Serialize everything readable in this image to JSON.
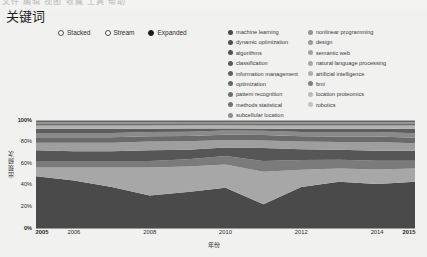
{
  "window": {
    "ghost_strip_text": "文件  编辑  视图  收藏  工具  帮助"
  },
  "header": {
    "title": "关键词"
  },
  "layout_controls": {
    "name": "layout",
    "options": [
      {
        "label": "Stacked",
        "selected": false
      },
      {
        "label": "Stream",
        "selected": false
      },
      {
        "label": "Expanded",
        "selected": true
      }
    ]
  },
  "legend": {
    "position": "top-right",
    "columns": [
      [
        {
          "label": "machine learning",
          "color": "#4a4a4a"
        },
        {
          "label": "dynamic optimization",
          "color": "#4f4f4f"
        },
        {
          "label": "algorithms",
          "color": "#545454"
        },
        {
          "label": "classification",
          "color": "#5a5a5a"
        },
        {
          "label": "information management",
          "color": "#616161"
        },
        {
          "label": "optimization",
          "color": "#676767"
        },
        {
          "label": "pattern recognition",
          "color": "#6e6e6e"
        },
        {
          "label": "methods  statistical",
          "color": "#757575"
        },
        {
          "label": "subcellular location",
          "color": "#8e8e8e"
        }
      ],
      [
        {
          "label": "nonlinear programming",
          "color": "#949494"
        },
        {
          "label": "design",
          "color": "#9b9b9b"
        },
        {
          "label": "semantic web",
          "color": "#a2a2a2"
        },
        {
          "label": "natural language processing",
          "color": "#a9a9a9"
        },
        {
          "label": "artificial intelligence",
          "color": "#b0b0b0"
        },
        {
          "label": "bmi",
          "color": "#808080"
        },
        {
          "label": "location proteomics",
          "color": "#bcbcbc"
        },
        {
          "label": "robotics",
          "color": "#c4c4c4"
        }
      ]
    ]
  },
  "chart_data": {
    "type": "area",
    "title": "关键词",
    "xlabel": "年份",
    "ylabel": "出现频次",
    "grid": false,
    "legend_position": "top-right",
    "normalized": true,
    "xlim": [
      2005,
      2015
    ],
    "ylim": [
      0,
      100
    ],
    "x": [
      2005,
      2006,
      2007,
      2008,
      2009,
      2010,
      2011,
      2012,
      2013,
      2014,
      2015
    ],
    "xticks": [
      "2005",
      "2006",
      "2008",
      "2010",
      "2012",
      "2014",
      "2015"
    ],
    "xtick_values": [
      2005,
      2006,
      2008,
      2010,
      2012,
      2014,
      2015
    ],
    "xtick_bold": [
      true,
      false,
      false,
      false,
      false,
      false,
      true
    ],
    "yticks": [
      "0%",
      "20%",
      "40%",
      "60%",
      "80%",
      "100%"
    ],
    "ytick_values": [
      0,
      20,
      40,
      60,
      80,
      100
    ],
    "series": [
      {
        "name": "machine learning",
        "color": "#4a4a4a",
        "values": [
          48,
          44,
          38,
          30,
          34,
          38,
          22,
          38,
          42,
          40,
          42
        ]
      },
      {
        "name": "dynamic optimization",
        "color": "#4f4f4f",
        "values": [
          0,
          0,
          0,
          0,
          0,
          0,
          0,
          0,
          0,
          0,
          0
        ]
      },
      {
        "name": "algorithms",
        "color": "#a7a7a7",
        "values": [
          8,
          12,
          18,
          26,
          24,
          22,
          30,
          16,
          12,
          13,
          12
        ]
      },
      {
        "name": "classification",
        "color": "#7b7b7b",
        "values": [
          6,
          6,
          6,
          6,
          7,
          8,
          10,
          9,
          8,
          8,
          7
        ]
      },
      {
        "name": "information management",
        "color": "#565656",
        "values": [
          10,
          9,
          9,
          10,
          9,
          8,
          12,
          10,
          9,
          9,
          9
        ]
      },
      {
        "name": "optimization",
        "color": "#9e9e9e",
        "values": [
          7,
          8,
          8,
          8,
          8,
          7,
          7,
          7,
          7,
          8,
          7
        ]
      },
      {
        "name": "pattern recognition",
        "color": "#6a6a6a",
        "values": [
          5,
          5,
          5,
          5,
          5,
          5,
          5,
          5,
          5,
          5,
          5
        ]
      },
      {
        "name": "methods  statistical",
        "color": "#8a8a8a",
        "values": [
          4,
          4,
          4,
          4,
          4,
          4,
          4,
          4,
          4,
          4,
          4
        ]
      },
      {
        "name": "subcellular location",
        "color": "#5d5d5d",
        "values": [
          4,
          4,
          4,
          3,
          3,
          2,
          2,
          3,
          3,
          3,
          4
        ]
      },
      {
        "name": "nonlinear programming",
        "color": "#b2b2b2",
        "values": [
          3,
          3,
          3,
          3,
          3,
          3,
          3,
          3,
          3,
          3,
          3
        ]
      },
      {
        "name": "design",
        "color": "#707070",
        "values": [
          2,
          2,
          2,
          2,
          2,
          2,
          2,
          2,
          2,
          2,
          2
        ]
      },
      {
        "name": "semantic web",
        "color": "#969696",
        "values": [
          1,
          1,
          1,
          1,
          1,
          1,
          1,
          1,
          1,
          1,
          1
        ]
      },
      {
        "name": "natural language processing",
        "color": "#616161",
        "values": [
          1,
          1,
          1,
          1,
          1,
          1,
          1,
          1,
          1,
          1,
          1
        ]
      },
      {
        "name": "artificial intelligence",
        "color": "#adadad",
        "values": [
          1,
          1,
          1,
          1,
          1,
          1,
          1,
          1,
          1,
          1,
          1
        ]
      }
    ]
  }
}
